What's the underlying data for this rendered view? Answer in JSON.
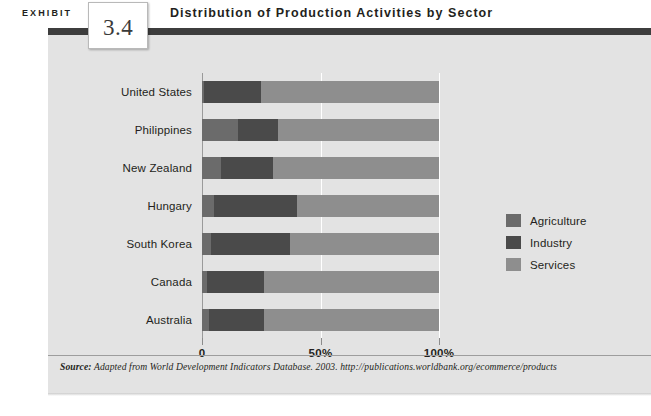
{
  "header": {
    "exhibit_word": "EXHIBIT",
    "exhibit_number": "3.4",
    "title": "Distribution of Production Activities by Sector"
  },
  "legend": {
    "items": [
      {
        "label": "Agriculture",
        "color": "#6b6b6b"
      },
      {
        "label": "Industry",
        "color": "#4a4a4a"
      },
      {
        "label": "Services",
        "color": "#8e8e8e"
      }
    ]
  },
  "axis": {
    "ticks": [
      {
        "label": "0",
        "value": 0
      },
      {
        "label": "50%",
        "value": 50
      },
      {
        "label": "100%",
        "value": 100
      }
    ]
  },
  "source": {
    "prefix": "Source:",
    "text": "Adapted from World Development Indicators Database. 2003. http://publications.worldbank.org/ecommerce/products"
  },
  "chart_data": {
    "type": "bar",
    "orientation": "horizontal",
    "stacked": true,
    "title": "Distribution of Production Activities by Sector",
    "xlabel": "",
    "ylabel": "",
    "xlim": [
      0,
      100
    ],
    "grid": true,
    "legend_position": "right",
    "categories": [
      "United States",
      "Philippines",
      "New Zealand",
      "Hungary",
      "South Korea",
      "Canada",
      "Australia"
    ],
    "series": [
      {
        "name": "Agriculture",
        "color": "#6b6b6b",
        "values": [
          1,
          15,
          8,
          5,
          4,
          2,
          3
        ]
      },
      {
        "name": "Industry",
        "color": "#4a4a4a",
        "values": [
          24,
          17,
          22,
          35,
          33,
          24,
          23
        ]
      },
      {
        "name": "Services",
        "color": "#8e8e8e",
        "values": [
          75,
          68,
          70,
          60,
          63,
          74,
          74
        ]
      }
    ]
  }
}
